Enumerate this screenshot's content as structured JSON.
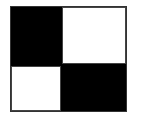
{
  "diagram": {
    "type": "checkerboard-2x2",
    "cells": [
      {
        "position": "top-left",
        "color": "#000000"
      },
      {
        "position": "top-right",
        "color": "#ffffff"
      },
      {
        "position": "bottom-left",
        "color": "#ffffff"
      },
      {
        "position": "bottom-right",
        "color": "#000000"
      }
    ],
    "border_color": "#333333"
  }
}
